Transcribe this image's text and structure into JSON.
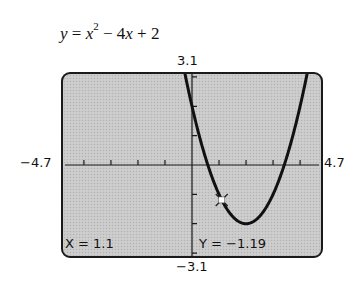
{
  "equation": {
    "lhs": "y",
    "eq": " = ",
    "x": "x",
    "exp": "2",
    "rest1": " − 4",
    "x2": "x",
    "rest2": " + 2"
  },
  "window": {
    "ymax_label": "3.1",
    "ymin_label": "−3.1",
    "xmin_label": "−4.7",
    "xmax_label": "4.7"
  },
  "readout": {
    "x_label": "X = 1.1",
    "y_label": "Y = −1.19"
  },
  "chart_data": {
    "type": "line",
    "function": "x^2 - 4x + 2",
    "xlim": [
      -4.7,
      4.7
    ],
    "ylim": [
      -3.1,
      3.1
    ],
    "xscale": 1,
    "yscale": 1,
    "x_tick_labels": [
      "−4.7",
      "4.7"
    ],
    "y_tick_labels": [
      "3.1",
      "−3.1"
    ],
    "grid": false,
    "trace_cursor": {
      "x": 1.1,
      "y": -1.19
    },
    "readout": {
      "X": 1.1,
      "Y": -1.19
    },
    "vertex": {
      "x": 2,
      "y": -2
    },
    "x_intercepts": [
      0.59,
      3.41
    ],
    "y_intercept": 2,
    "x": [
      -0.2,
      0,
      0.5,
      1,
      1.1,
      1.5,
      2,
      2.5,
      3,
      3.5,
      4,
      4.2
    ],
    "y": [
      2.84,
      2,
      0.25,
      -1,
      -1.19,
      -1.75,
      -2,
      -1.75,
      -1,
      0.25,
      2,
      2.84
    ]
  }
}
